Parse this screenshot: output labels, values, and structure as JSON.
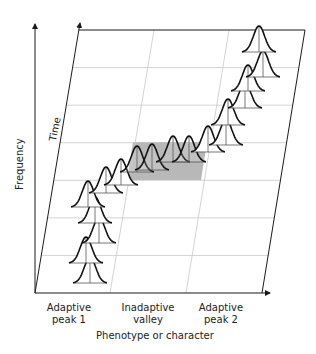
{
  "figure": {
    "axes": {
      "y_label": "Frequency",
      "depth_label": "Time",
      "x_label": "Phenotype or character"
    },
    "regions": [
      {
        "label_line1": "Adaptive",
        "label_line2": "peak 1"
      },
      {
        "label_line1": "Inadaptive",
        "label_line2": "valley"
      },
      {
        "label_line1": "Adaptive",
        "label_line2": "peak 2"
      }
    ],
    "colors": {
      "axis": "#1a1a1a",
      "grid": "#c8c8c8",
      "valley_shade": "#b8b8b8",
      "curve": "#111111",
      "curve_median": "#555555"
    },
    "grid": {
      "rows": 7,
      "columns": 3,
      "shaded_cell": {
        "row_from_top": 4,
        "column": 2
      }
    },
    "distributions": [
      {
        "cx": 90,
        "base": 283,
        "region": "peak 1"
      },
      {
        "cx": 86,
        "base": 263,
        "region": "peak 1"
      },
      {
        "cx": 99,
        "base": 243,
        "region": "peak 1"
      },
      {
        "cx": 95,
        "base": 223,
        "region": "peak 1"
      },
      {
        "cx": 88,
        "base": 207,
        "region": "peak 1"
      },
      {
        "cx": 106,
        "base": 193,
        "region": "transition"
      },
      {
        "cx": 121,
        "base": 185,
        "region": "transition"
      },
      {
        "cx": 137,
        "base": 172,
        "region": "valley"
      },
      {
        "cx": 152,
        "base": 170,
        "region": "valley"
      },
      {
        "cx": 173,
        "base": 162,
        "region": "valley"
      },
      {
        "cx": 189,
        "base": 162,
        "region": "valley"
      },
      {
        "cx": 208,
        "base": 152,
        "region": "transition"
      },
      {
        "cx": 226,
        "base": 145,
        "region": "peak 2"
      },
      {
        "cx": 228,
        "base": 125,
        "region": "peak 2"
      },
      {
        "cx": 245,
        "base": 108,
        "region": "peak 2"
      },
      {
        "cx": 248,
        "base": 91,
        "region": "peak 2"
      },
      {
        "cx": 263,
        "base": 77,
        "region": "peak 2"
      },
      {
        "cx": 259,
        "base": 52,
        "region": "peak 2"
      }
    ]
  }
}
